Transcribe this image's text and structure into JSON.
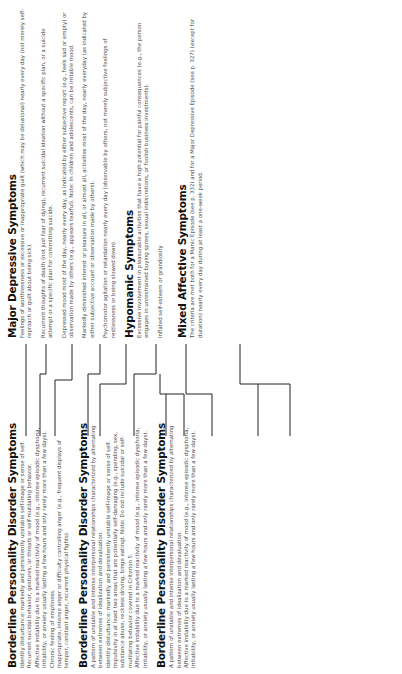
{
  "left_column": {
    "sections": [
      {
        "title": "Borderline Personality Disorder Symptoms",
        "items": [
          "Identity disturbance: markedly and persistently unstable self-image or sense of self.",
          "Recurrent suicidal behavior, gestures, or threats or self-mutilating behavior.",
          "Affective instability due to a marked reactivity of mood (e.g., intense episodic dysphoria, irritability, or anxiety usually lasting a few hours and only rarely more than a few days).",
          "Chronic feeling of emptiness.",
          "Inappropriate, intense anger or difficulty controlling anger (e.g., frequent displays of temper, constant anger, recurrent physical fights)."
        ]
      },
      {
        "title": "Borderline Personality Disorder Symptoms",
        "items": [
          "A pattern of unstable and intense interpersonal relationships characterized by alternating between extremes of idealization and devaluation.",
          "Identity disturbance: markedly and persistently unstable self-image or sense of self.",
          "Impulsivity in at least two areas that are potentially self-damaging (e.g., spending, sex, substance abuse, reckless driving, binge eating). Note: Do not include suicidal or self-mutilating behavior covered in Criterion 5.",
          "Affective instability due to a marked reactivity of mood (e.g., intense episodic dysphoria, irritability, or anxiety usually lasting a few hours and only rarely more than a few days)."
        ]
      },
      {
        "title": "Borderline Personality Disorder Symptoms",
        "items": [
          "A pattern of unstable and intense interpersonal relationships characterized by alternating between extremes of idealization and devaluation.",
          "Affective instability due to a marked reactivity of mood (e.g., intense episodic dysphoria, irritability, or anxiety usually lasting a few hours and only rarely more than a few days)."
        ]
      }
    ]
  },
  "right_column": {
    "sections": [
      {
        "title": "Major Depressive Symptoms",
        "items": [
          "Feelings of worthlessness or excessive or inappropriate guilt (which may be delusional) nearly every day (not merely self-reproach or guilt about being sick).",
          "Recurrent thoughts of death (not just fear of dying), recurrent suicidal ideation without a specific plan, or a suicide attempt or a specific plan for committing suicide.",
          "Depressed mood most of the day, nearly every day, as indicated by either subjective report (e.g., feels sad or empty) or observation made by others (e.g., appears tearful). Note: In children and adolescents, can be irritable mood.",
          "Markedly diminished interest or pleasure in all, or almost all, activities most of the day, nearly everyday (as indicated by either subjective account or observation made by others).",
          "Psychomotor agitation or retardation nearly every day (observable by others, not merely subjective feelings of restlessness or being slowed down)."
        ]
      },
      {
        "title": "Hypomanic Symptoms",
        "items": [
          "Excessive involvement in pleasurable activities that have a high potential for painful consequences (e.g., the person engages in unrestrained buying sprees, sexual indiscretions, or foolish business investments).",
          "Inflated self-esteem or grandiosity"
        ]
      },
      {
        "title": "Mixed Affective Symptoms",
        "items": [
          "The criteria are met both for a Manic Episode (see p. 332) and for a Major Depressive Episode (see p. 327) (except for duration) nearly every day during at least a one-week period."
        ]
      }
    ]
  }
}
